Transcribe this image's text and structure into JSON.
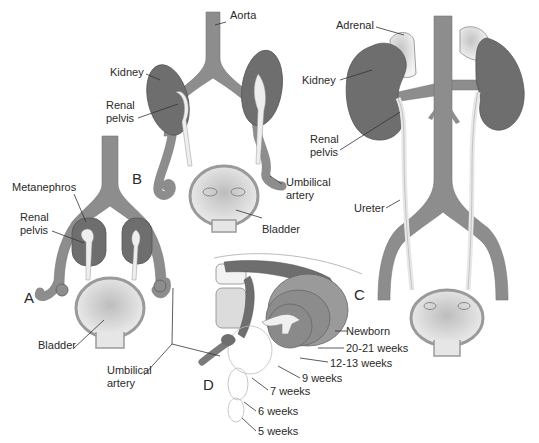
{
  "figure": {
    "colors": {
      "vessel": "#8a8a8a",
      "vessel_edge": "#6f6f6f",
      "kidney": "#6b6b6b",
      "kidney_edge": "#555555",
      "pelvis": "#eeeeee",
      "adrenal": "#dcdcdc",
      "bladder_fill": "#cfcfcf",
      "bladder_wall": "#9a9a9a",
      "leader_line": "#333333",
      "text": "#2a2a2a"
    }
  },
  "panels": {
    "A": "A",
    "B": "B",
    "C": "C",
    "D": "D"
  },
  "labels": {
    "aorta": "Aorta",
    "kidney_b": "Kidney",
    "renal_pelvis_b_1": "Renal",
    "renal_pelvis_b_2": "pelvis",
    "umbilical_artery_b_1": "Umbilical",
    "umbilical_artery_b_2": "artery",
    "bladder_b": "Bladder",
    "metanephros_a": "Metanephros",
    "renal_pelvis_a_1": "Renal",
    "renal_pelvis_a_2": "pelvis",
    "bladder_a": "Bladder",
    "umbilical_artery_a_1": "Umbilical",
    "umbilical_artery_a_2": "artery",
    "adrenal_c": "Adrenal",
    "kidney_c": "Kidney",
    "renal_pelvis_c_1": "Renal",
    "renal_pelvis_c_2": "pelvis",
    "ureter_c": "Ureter"
  },
  "ascent_stages": [
    {
      "label": "Newborn"
    },
    {
      "label": "20-21 weeks"
    },
    {
      "label": "12-13 weeks"
    },
    {
      "label": "9 weeks"
    },
    {
      "label": "7 weeks"
    },
    {
      "label": "6 weeks"
    },
    {
      "label": "5 weeks"
    }
  ]
}
